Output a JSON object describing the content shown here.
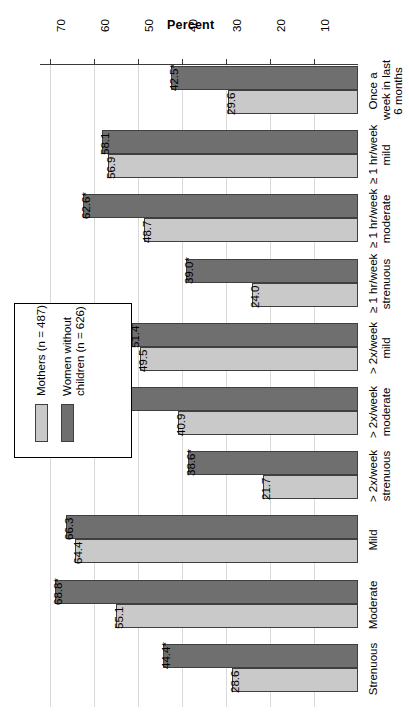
{
  "chart_data": {
    "type": "bar",
    "orientation": "horizontal-rotated",
    "title": "",
    "xlabel": "",
    "ylabel": "Percent",
    "axis_title": "Percent",
    "categories": [
      "Once a\nweek in last\n6 months",
      "≥ 1 hr/week\nmild",
      "≥ 1 hr/week\nmoderate",
      "≥ 1 hr/week\nstrenuous",
      "> 2x/week\nmild",
      "> 2x/week\nmoderate",
      "> 2x/week\nstrenuous",
      "Mild",
      "Moderate",
      "Strenuous"
    ],
    "tick_labels": [
      "70",
      "60",
      "50",
      "40",
      "30",
      "20",
      "10"
    ],
    "tick_values": [
      70,
      60,
      50,
      40,
      30,
      20,
      10
    ],
    "ylim": [
      0,
      75
    ],
    "grid": true,
    "legend_position": "left-middle",
    "series": [
      {
        "name": "Mothers (n = 487)",
        "color": "#c9c9c9",
        "values": [
          29.6,
          56.9,
          48.7,
          24.0,
          49.5,
          40.9,
          21.7,
          64.4,
          55.1,
          28.6
        ],
        "value_labels": [
          "29.6",
          "56.9",
          "48.7",
          "24.0",
          "49.5",
          "40.9",
          "21.7",
          "64.4",
          "55.1",
          "28.6"
        ]
      },
      {
        "name": "Women without children (n = 626)",
        "color": "#6f6f6f",
        "values": [
          42.5,
          58.1,
          62.6,
          39.0,
          51.4,
          53.8,
          38.6,
          66.3,
          68.8,
          44.4
        ],
        "value_labels": [
          "42.5*",
          "58.1",
          "62.6*",
          "39.0*",
          "51.4",
          "53.8*",
          "38.6*",
          "66.3",
          "68.8*",
          "44.4*"
        ]
      }
    ],
    "significance_marker": "*"
  },
  "legend": {
    "items": [
      {
        "label": "Mothers (n = 487)",
        "color": "#c9c9c9"
      },
      {
        "label": "Women without\nchildren (n = 626)",
        "color": "#6f6f6f"
      }
    ]
  },
  "colors": {
    "series_light": "#c9c9c9",
    "series_dark": "#6f6f6f",
    "axis": "#3a3a3a",
    "grid": "#d9d9d9",
    "text": "#000000"
  }
}
